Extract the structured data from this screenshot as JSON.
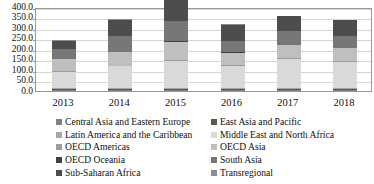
{
  "chart_data": {
    "type": "bar",
    "subtype": "stacked-column",
    "title": "",
    "xlabel": "",
    "ylabel": "",
    "categories": [
      "2013",
      "2014",
      "2015",
      "2016",
      "2017",
      "2018"
    ],
    "ylim": [
      0.0,
      400.0
    ],
    "ytick_step": 50.0,
    "ytick_labels": [
      "400.0",
      "350.0",
      "300.0",
      "250.0",
      "200.0",
      "150.0",
      "100.0",
      "50.0",
      "0.0"
    ],
    "ytick_values": [
      400.0,
      350.0,
      300.0,
      250.0,
      200.0,
      150.0,
      100.0,
      50.0,
      0.0
    ],
    "grid": true,
    "grid_axis": "y",
    "legend_position": "bottom",
    "legend_columns": 2,
    "series": [
      {
        "name": "Central Asia and Eastern Europe",
        "color": "#808080",
        "values": [
          3.0,
          3.0,
          4.0,
          3.0,
          3.0,
          3.0
        ]
      },
      {
        "name": "East Asia and Pacific",
        "color": "#595959",
        "values": [
          4.0,
          4.0,
          5.0,
          4.0,
          4.0,
          4.0
        ]
      },
      {
        "name": "Latin America and the Caribbean",
        "color": "#a6a6a6",
        "values": [
          4.0,
          4.0,
          5.0,
          4.0,
          4.0,
          4.0
        ]
      },
      {
        "name": "Middle East and North Africa",
        "color": "#d9d9d9",
        "values": [
          78.0,
          104.0,
          127.0,
          108.0,
          140.0,
          126.0
        ]
      },
      {
        "name": "OECD Americas",
        "color": "#9c9c9c",
        "values": [
          3.0,
          3.0,
          4.0,
          3.0,
          3.0,
          3.0
        ]
      },
      {
        "name": "OECD Asia",
        "color": "#bfbfbf",
        "values": [
          57.0,
          65.0,
          88.0,
          57.0,
          62.0,
          62.0
        ]
      },
      {
        "name": "OECD Oceania",
        "color": "#404040",
        "values": [
          3.0,
          3.0,
          3.0,
          3.0,
          3.0,
          3.0
        ]
      },
      {
        "name": "South Asia",
        "color": "#777777",
        "values": [
          47.0,
          72.0,
          95.0,
          53.0,
          65.0,
          57.0
        ]
      },
      {
        "name": "Sub-Saharan Africa",
        "color": "#4d4d4d",
        "values": [
          39.0,
          79.0,
          108.0,
          79.0,
          70.0,
          72.0
        ]
      },
      {
        "name": "Transregional",
        "color": "#8c8c8c",
        "values": [
          2.0,
          2.0,
          3.0,
          2.0,
          2.0,
          2.0
        ]
      }
    ],
    "totals": [
      240.0,
      339.0,
      442.0,
      316.0,
      356.0,
      336.0
    ]
  }
}
